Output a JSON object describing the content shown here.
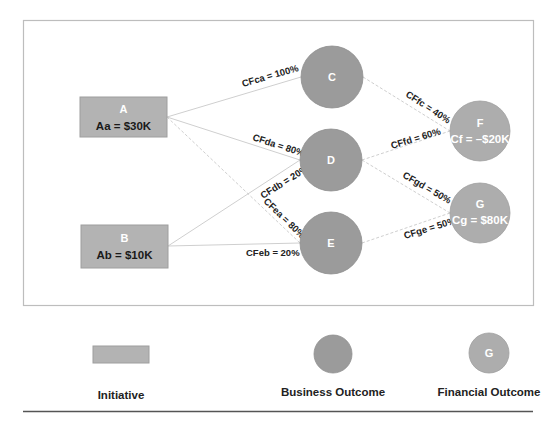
{
  "diagram": {
    "colors": {
      "frame_border": "#bdbdbd",
      "initiative_fill": "#b3b3b3",
      "initiative_border": "#9e9e9e",
      "business_fill": "#9b9b9b",
      "financial_fill": "#adadad",
      "edge": "#cfcfcf",
      "node_label": "#ffffff",
      "initiative_value_text": "#1a1a1a",
      "financial_value_text": "#ffffff",
      "label_text": "#222222",
      "rule": "#555555"
    },
    "initiatives": [
      {
        "id": "A",
        "label": "A",
        "value_text": "Aa = $30K"
      },
      {
        "id": "B",
        "label": "B",
        "value_text": "Ab = $10K"
      }
    ],
    "business_outcomes": [
      {
        "id": "C",
        "label": "C"
      },
      {
        "id": "D",
        "label": "D"
      },
      {
        "id": "E",
        "label": "E"
      }
    ],
    "financial_outcomes": [
      {
        "id": "F",
        "label": "F",
        "value_text": "Cf = –$20K"
      },
      {
        "id": "G",
        "label": "G",
        "value_text": "Cg = $80K"
      }
    ],
    "edges": [
      {
        "from": "A",
        "to": "C",
        "label": "CFca = 100%"
      },
      {
        "from": "A",
        "to": "D",
        "label": "CFda = 80%"
      },
      {
        "from": "A",
        "to": "E",
        "label": "CFea = 80%"
      },
      {
        "from": "B",
        "to": "D",
        "label": "CFdb = 20%"
      },
      {
        "from": "B",
        "to": "E",
        "label": "CFeb = 20%"
      },
      {
        "from": "C",
        "to": "F",
        "label": "CFfc = 40%"
      },
      {
        "from": "D",
        "to": "F",
        "label": "CFfd = 60%"
      },
      {
        "from": "D",
        "to": "G",
        "label": "CFgd = 50%"
      },
      {
        "from": "E",
        "to": "G",
        "label": "CFge = 50%"
      }
    ]
  },
  "legend": {
    "initiative_label": "Initiative",
    "business_outcome_label": "Business Outcome",
    "financial_outcome_label": "Financial Outcome",
    "financial_sample_letter": "G"
  }
}
